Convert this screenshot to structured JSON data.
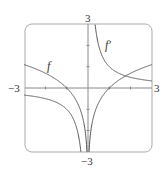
{
  "chart_data": {
    "type": "line",
    "title": "",
    "xlabel": "",
    "ylabel": "",
    "xlim": [
      -3,
      3
    ],
    "ylim": [
      -3,
      3
    ],
    "grid": false,
    "frame": "rounded-box",
    "ticks": {
      "x": [
        -2,
        -1,
        1,
        2
      ],
      "y": [
        -2,
        -1,
        1,
        2
      ]
    },
    "tick_labels": {
      "x_min": "−3",
      "x_max": "3",
      "y_min": "−3",
      "y_max": "3"
    },
    "series": [
      {
        "name": "f",
        "label": "f",
        "expression": "ln|x|",
        "color": "#555555"
      },
      {
        "name": "f'",
        "label": "f′",
        "expression": "1/x",
        "color": "#555555"
      }
    ]
  },
  "labels": {
    "x_min": "−3",
    "x_max": "3",
    "y_min": "−3",
    "y_max": "3",
    "f": "f",
    "f_prime": "f′"
  }
}
